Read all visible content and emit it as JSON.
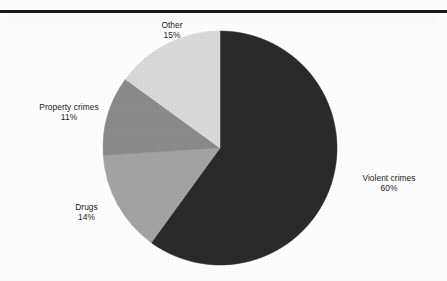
{
  "figure": {
    "background_color": "#fefefe",
    "top_rule_color": "#191919"
  },
  "chart_data": {
    "type": "pie",
    "title": "",
    "subtitle": "",
    "xlabel": "",
    "ylabel": "",
    "legend_position": "none",
    "label_style": "outside-callout-text",
    "start_angle_deg": 0,
    "direction": "clockwise",
    "center_px": [
      220,
      148
    ],
    "radius_px": 117,
    "categories": [
      "Violent crimes",
      "Drugs",
      "Property crimes",
      "Other"
    ],
    "values": [
      60,
      14,
      11,
      15
    ],
    "value_unit": "%",
    "slices": [
      {
        "name": "violent-crimes",
        "label": "Violent crimes",
        "value": 60,
        "value_text": "60%",
        "color": "#2a2a2a",
        "start_deg": 0,
        "end_deg": 216
      },
      {
        "name": "drugs",
        "label": "Drugs",
        "value": 14,
        "value_text": "14%",
        "color": "#a3a3a3",
        "start_deg": 216,
        "end_deg": 266.4
      },
      {
        "name": "property-crimes",
        "label": "Property crimes",
        "value": 11,
        "value_text": "11%",
        "color": "#8a8a8a",
        "start_deg": 266.4,
        "end_deg": 306
      },
      {
        "name": "other",
        "label": "Other",
        "value": 15,
        "value_text": "15%",
        "color": "#d9d9d9",
        "start_deg": 306,
        "end_deg": 360
      }
    ]
  },
  "labels": {
    "violent": {
      "name": "Violent crimes",
      "pct": "60%"
    },
    "drugs": {
      "name": "Drugs",
      "pct": "14%"
    },
    "property": {
      "name": "Property crimes",
      "pct": "11%"
    },
    "other": {
      "name": "Other",
      "pct": "15%"
    }
  }
}
